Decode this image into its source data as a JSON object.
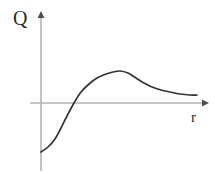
{
  "figure": {
    "width": 215,
    "height": 174,
    "background_color": "#ffffff"
  },
  "axes": {
    "y_axis_label": "Q",
    "x_axis_label": "r",
    "axis_color": "#b3b3b3",
    "curve_color": "#333333",
    "label_color": "#2b2b2b"
  },
  "chart_data": {
    "type": "line",
    "title": "",
    "subtitle": "",
    "xlabel": "r",
    "ylabel": "Q",
    "grid": false,
    "legend": null,
    "annotations": [],
    "axis_style": {
      "x_axis_arrow": true,
      "y_axis_arrow": true,
      "x_axis_tick_labels": [],
      "y_axis_tick_labels": [],
      "origin_px": [
        41,
        103
      ]
    },
    "xlim": [
      0,
      215
    ],
    "ylim": [
      0,
      174
    ],
    "series": [
      {
        "name": "Q(r)",
        "color": "#333333",
        "points_px": [
          [
            41,
            152
          ],
          [
            48,
            147
          ],
          [
            55,
            139
          ],
          [
            61,
            128
          ],
          [
            67,
            116
          ],
          [
            74,
            103
          ],
          [
            81,
            92
          ],
          [
            89,
            84
          ],
          [
            97,
            78
          ],
          [
            106,
            74
          ],
          [
            113,
            72
          ],
          [
            120,
            71
          ],
          [
            128,
            73
          ],
          [
            136,
            78
          ],
          [
            144,
            83
          ],
          [
            152,
            87
          ],
          [
            161,
            90
          ],
          [
            170,
            92
          ],
          [
            180,
            94
          ],
          [
            190,
            95
          ],
          [
            197,
            95
          ]
        ],
        "features": {
          "start_value_sign": "negative",
          "zero_crossing_px_x": 74,
          "peak_px": [
            120,
            71
          ],
          "tail_px": [
            197,
            95
          ],
          "tail_behavior": "asymptotic-positive"
        }
      }
    ]
  }
}
